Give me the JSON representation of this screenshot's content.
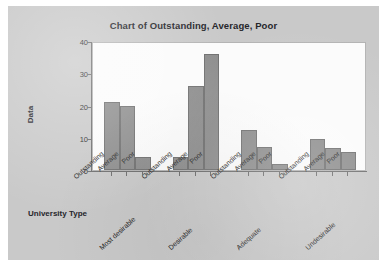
{
  "chart_data": {
    "type": "bar",
    "title": "Chart of Outstanding, Average, Poor",
    "xlabel": "University Type",
    "ylabel": "Data",
    "ylim": [
      0,
      40
    ],
    "yticks": [
      0,
      10,
      20,
      30,
      40
    ],
    "grid": false,
    "legend": null,
    "categories": [
      "Most desirable",
      "Desirable",
      "Adequate",
      "Undesirable"
    ],
    "subcategories": [
      "Outstanding",
      "Average",
      "Poor"
    ],
    "series": [
      {
        "name": "Outstanding",
        "values": [
          21,
          4,
          12.5,
          9.5
        ]
      },
      {
        "name": "Average",
        "values": [
          20,
          26,
          7,
          6.8
        ]
      },
      {
        "name": "Poor",
        "values": [
          4,
          36,
          2,
          5.7
        ]
      }
    ],
    "groups": [
      {
        "label": "Most desirable",
        "bars": [
          {
            "label": "Outstanding",
            "value": 21
          },
          {
            "label": "Average",
            "value": 20
          },
          {
            "label": "Poor",
            "value": 4
          }
        ]
      },
      {
        "label": "Desirable",
        "bars": [
          {
            "label": "Outstanding",
            "value": 4
          },
          {
            "label": "Average",
            "value": 26
          },
          {
            "label": "Poor",
            "value": 36
          }
        ]
      },
      {
        "label": "Adequate",
        "bars": [
          {
            "label": "Outstanding",
            "value": 12.5
          },
          {
            "label": "Average",
            "value": 7
          },
          {
            "label": "Poor",
            "value": 2
          }
        ]
      },
      {
        "label": "Undesirable",
        "bars": [
          {
            "label": "Outstanding",
            "value": 9.5
          },
          {
            "label": "Average",
            "value": 6.8
          },
          {
            "label": "Poor",
            "value": 5.7
          }
        ]
      }
    ],
    "colors": {
      "bar_fill": "#8d8d8d",
      "bar_edge": "#6f6f6f",
      "plot_background": "#fbfbfb",
      "figure_background": "#c9c9c9",
      "axis": "#6d6d6d",
      "text": "#26262b"
    }
  }
}
